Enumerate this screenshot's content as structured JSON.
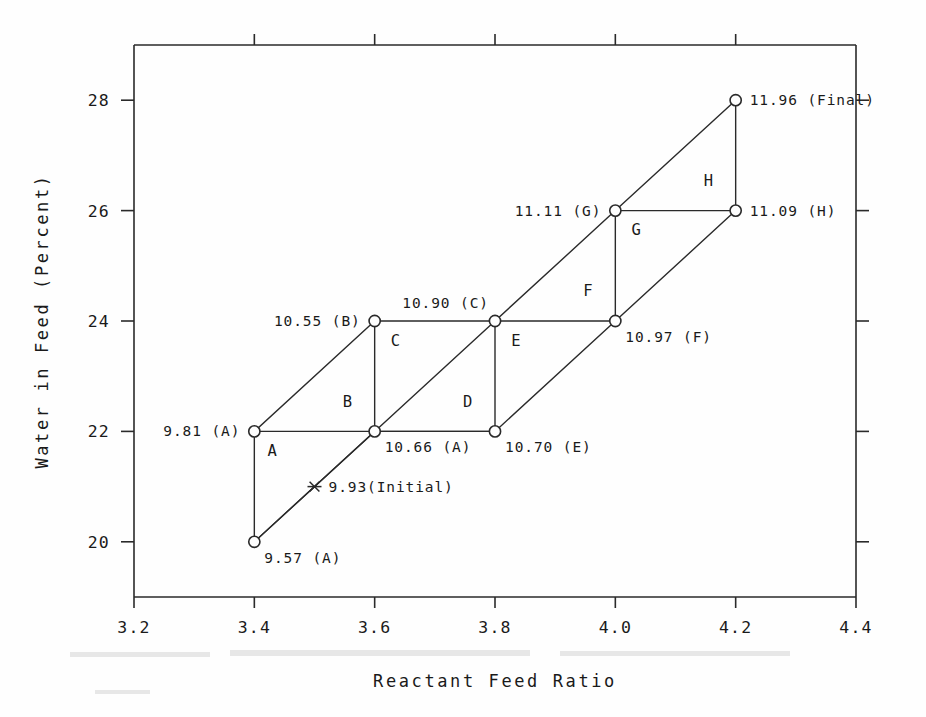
{
  "chart_data": {
    "type": "scatter",
    "title": "",
    "xlabel": "Reactant Feed Ratio",
    "ylabel": "Water in Feed (Percent)",
    "xlim": [
      3.2,
      4.4
    ],
    "ylim": [
      19.0,
      29.0
    ],
    "xticks": [
      "3.2",
      "3.4",
      "3.6",
      "3.8",
      "4.0",
      "4.2",
      "4.4"
    ],
    "xtickvalues": [
      3.2,
      3.4,
      3.6,
      3.8,
      4.0,
      4.2,
      4.4
    ],
    "yticks": [
      "20",
      "22",
      "24",
      "26",
      "28"
    ],
    "ytickvalues": [
      20,
      22,
      24,
      26,
      28
    ],
    "grid": false,
    "legend": null,
    "marker_style": "open-circle",
    "points": [
      {
        "id": "p_start",
        "x": 3.4,
        "y": 20,
        "value": "9.57",
        "vertex": "A",
        "label": "9.57 (A)",
        "marker": "circle",
        "label_pos": "below-right"
      },
      {
        "id": "p_initial",
        "x": 3.5,
        "y": 21,
        "value": "9.93",
        "vertex": "Initial",
        "label": "9.93(Initial)",
        "marker": "star",
        "label_pos": "right"
      },
      {
        "id": "p_a",
        "x": 3.4,
        "y": 22,
        "value": "9.81",
        "vertex": "A",
        "label": "9.81 (A)",
        "marker": "circle",
        "label_pos": "left"
      },
      {
        "id": "p_a2",
        "x": 3.6,
        "y": 22,
        "value": "10.66",
        "vertex": "A",
        "label": "10.66 (A)",
        "marker": "circle",
        "label_pos": "below-right"
      },
      {
        "id": "p_b",
        "x": 3.6,
        "y": 24,
        "value": "10.55",
        "vertex": "B",
        "label": "10.55 (B)",
        "marker": "circle",
        "label_pos": "left"
      },
      {
        "id": "p_c",
        "x": 3.8,
        "y": 24,
        "value": "10.90",
        "vertex": "C",
        "label": "10.90 (C)",
        "marker": "circle",
        "label_pos": "above-left"
      },
      {
        "id": "p_e",
        "x": 3.8,
        "y": 22,
        "value": "10.70",
        "vertex": "E",
        "label": "10.70 (E)",
        "marker": "circle",
        "label_pos": "below-right"
      },
      {
        "id": "p_f",
        "x": 4.0,
        "y": 24,
        "value": "10.97",
        "vertex": "F",
        "label": "10.97 (F)",
        "marker": "circle",
        "label_pos": "below-right"
      },
      {
        "id": "p_g",
        "x": 4.0,
        "y": 26,
        "value": "11.11",
        "vertex": "G",
        "label": "11.11 (G)",
        "marker": "circle",
        "label_pos": "left"
      },
      {
        "id": "p_h",
        "x": 4.2,
        "y": 26,
        "value": "11.09",
        "vertex": "H",
        "label": "11.09 (H)",
        "marker": "circle",
        "label_pos": "right"
      },
      {
        "id": "p_final",
        "x": 4.2,
        "y": 28,
        "value": "11.96",
        "vertex": "Final",
        "label": "11.96 (Final)",
        "marker": "circle",
        "label_pos": "right"
      }
    ],
    "region_labels": [
      {
        "id": "r_a",
        "text": "A",
        "x": 3.43,
        "y": 21.55
      },
      {
        "id": "r_b",
        "text": "B",
        "x": 3.555,
        "y": 22.45
      },
      {
        "id": "r_c",
        "text": "C",
        "x": 3.635,
        "y": 23.55
      },
      {
        "id": "r_d",
        "text": "D",
        "x": 3.755,
        "y": 22.45
      },
      {
        "id": "r_e",
        "text": "E",
        "x": 3.835,
        "y": 23.55
      },
      {
        "id": "r_f",
        "text": "F",
        "x": 3.955,
        "y": 24.45
      },
      {
        "id": "r_g",
        "text": "G",
        "x": 4.035,
        "y": 25.55
      },
      {
        "id": "r_h",
        "text": "H",
        "x": 4.155,
        "y": 26.45
      }
    ],
    "segments": [
      {
        "id": "seg_upper_diagonal",
        "kind": "diagonal",
        "points": [
          [
            3.4,
            20
          ],
          [
            3.6,
            22
          ],
          [
            3.8,
            24
          ],
          [
            4.0,
            26
          ],
          [
            4.2,
            28
          ]
        ]
      },
      {
        "id": "seg_lower_diagonal",
        "kind": "diagonal",
        "points": [
          [
            3.4,
            20
          ],
          [
            3.6,
            22
          ],
          [
            3.8,
            22
          ]
        ]
      },
      {
        "id": "seg_lower_diagonal_2",
        "kind": "diagonal",
        "points": [
          [
            3.8,
            22
          ],
          [
            4.0,
            24
          ],
          [
            4.2,
            26
          ]
        ]
      },
      {
        "id": "seg_upper_left_diagonal",
        "kind": "diagonal",
        "points": [
          [
            3.4,
            22
          ],
          [
            3.6,
            24
          ]
        ]
      },
      {
        "id": "seg_h_22",
        "kind": "horizontal",
        "points": [
          [
            3.4,
            22
          ],
          [
            3.8,
            22
          ]
        ]
      },
      {
        "id": "seg_h_24",
        "kind": "horizontal",
        "points": [
          [
            3.6,
            24
          ],
          [
            4.0,
            24
          ]
        ]
      },
      {
        "id": "seg_h_26",
        "kind": "horizontal",
        "points": [
          [
            4.0,
            26
          ],
          [
            4.2,
            26
          ]
        ]
      },
      {
        "id": "seg_v_34",
        "kind": "vertical",
        "points": [
          [
            3.4,
            22
          ],
          [
            3.4,
            20
          ]
        ]
      },
      {
        "id": "seg_v_36",
        "kind": "vertical",
        "points": [
          [
            3.6,
            24
          ],
          [
            3.6,
            22
          ]
        ]
      },
      {
        "id": "seg_v_38",
        "kind": "vertical",
        "points": [
          [
            3.8,
            24
          ],
          [
            3.8,
            22
          ]
        ]
      },
      {
        "id": "seg_v_40",
        "kind": "vertical",
        "points": [
          [
            4.0,
            26
          ],
          [
            4.0,
            24
          ]
        ]
      },
      {
        "id": "seg_v_42",
        "kind": "vertical",
        "points": [
          [
            4.2,
            28
          ],
          [
            4.2,
            26
          ]
        ]
      }
    ]
  },
  "colors": {
    "ink": "#2a2a2a",
    "text": "#1a1a1a",
    "background": "#fefefe"
  }
}
